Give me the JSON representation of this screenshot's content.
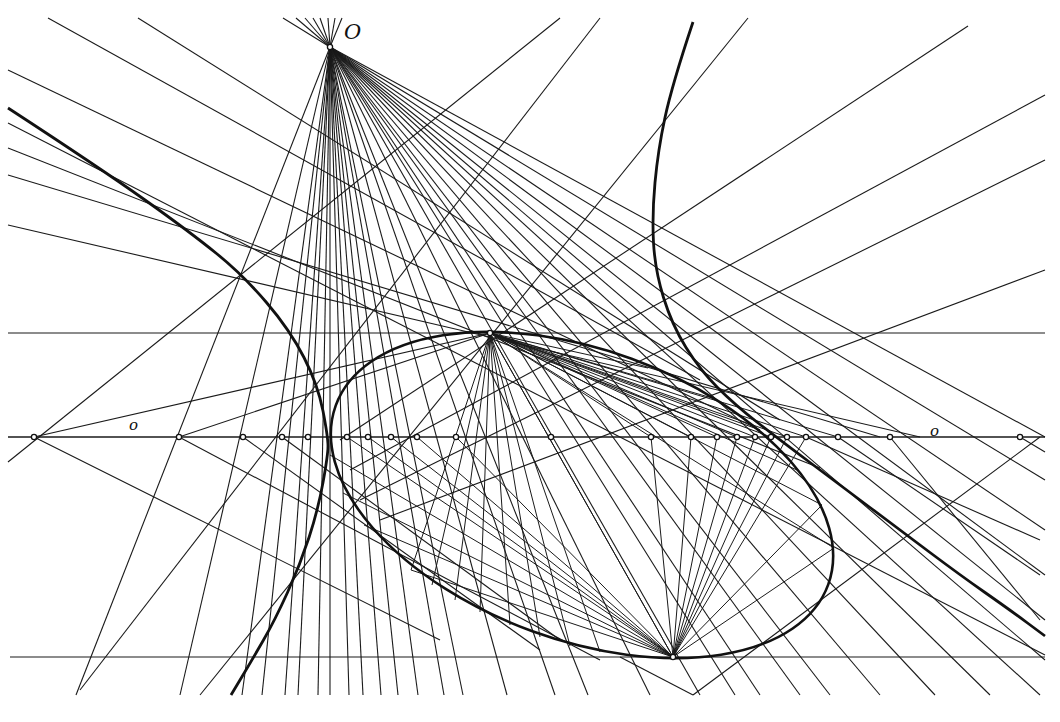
{
  "figure": {
    "type": "projective-geometry-construction",
    "background": "#ffffff",
    "ink_color": "#1a1a1a",
    "labels": {
      "center_point": "O",
      "axis_left": "o",
      "axis_right": "o"
    },
    "center_O": [
      330,
      47
    ],
    "axis": {
      "y": 437,
      "x_start": 8,
      "x_end": 1045
    },
    "horizontal_lines": [
      {
        "name": "upper-horizontal",
        "y": 333,
        "x_start": 8,
        "x_end": 1045
      },
      {
        "name": "lower-horizontal",
        "y": 657,
        "x_start": 10,
        "x_end": 1045
      }
    ],
    "axis_points": [
      34,
      179,
      243,
      282,
      308,
      347,
      368,
      391,
      417,
      456,
      551,
      651,
      691,
      717,
      737,
      755,
      771,
      787,
      806,
      838,
      890,
      1020
    ],
    "rays_from_O_to_bottom_x": [
      76,
      180,
      242,
      262,
      285,
      298,
      318,
      330,
      349,
      363,
      381,
      398,
      418,
      444,
      463,
      507,
      555,
      588
    ],
    "rays_from_O_to_right": [
      [
        1045,
        437
      ],
      [
        1045,
        480
      ],
      [
        1045,
        530
      ],
      [
        1045,
        575
      ],
      [
        1045,
        620
      ],
      [
        1045,
        660
      ],
      [
        1040,
        695
      ],
      [
        990,
        695
      ],
      [
        935,
        695
      ],
      [
        880,
        695
      ],
      [
        830,
        695
      ],
      [
        800,
        695
      ],
      [
        760,
        695
      ],
      [
        735,
        695
      ],
      [
        700,
        695
      ],
      [
        650,
        695
      ]
    ],
    "rays_from_O_upward": [
      [
        283,
        18
      ],
      [
        296,
        18
      ],
      [
        305,
        18
      ],
      [
        313,
        18
      ],
      [
        320,
        18
      ],
      [
        328,
        18
      ],
      [
        335,
        18
      ],
      [
        342,
        18
      ]
    ],
    "ellipse": {
      "cx": 582,
      "cy": 495,
      "rx": 262,
      "ry": 145,
      "rotation_deg": 20
    },
    "ellipse_points": {
      "top_point": [
        490,
        333
      ],
      "bottom_point": [
        673,
        657
      ]
    },
    "fan_from_top_point_to": [
      [
        411,
        570
      ],
      [
        432,
        585
      ],
      [
        455,
        600
      ],
      [
        480,
        612
      ],
      [
        510,
        625
      ],
      [
        540,
        637
      ],
      [
        570,
        646
      ],
      [
        600,
        652
      ],
      [
        673,
        657
      ],
      [
        651,
        437
      ],
      [
        690,
        437
      ],
      [
        717,
        437
      ],
      [
        737,
        437
      ],
      [
        755,
        437
      ],
      [
        771,
        437
      ],
      [
        787,
        437
      ],
      [
        806,
        437
      ],
      [
        838,
        437
      ],
      [
        834,
        548
      ],
      [
        822,
        505
      ],
      [
        797,
        470
      ],
      [
        760,
        430
      ],
      [
        712,
        398
      ],
      [
        648,
        368
      ]
    ],
    "fan_from_bottom_point_to": [
      [
        490,
        333
      ],
      [
        456,
        437
      ],
      [
        417,
        437
      ],
      [
        391,
        437
      ],
      [
        368,
        437
      ],
      [
        347,
        437
      ],
      [
        330,
        455
      ],
      [
        343,
        493
      ],
      [
        364,
        525
      ],
      [
        411,
        570
      ],
      [
        651,
        437
      ],
      [
        691,
        437
      ],
      [
        717,
        437
      ],
      [
        737,
        437
      ],
      [
        755,
        437
      ],
      [
        771,
        437
      ],
      [
        787,
        437
      ],
      [
        806,
        437
      ],
      [
        834,
        548
      ],
      [
        822,
        505
      ]
    ],
    "tangent_lines": [
      [
        [
          8,
          123
        ],
        [
          1045,
          655
        ]
      ],
      [
        [
          8,
          148
        ],
        [
          820,
          468
        ]
      ],
      [
        [
          8,
          175
        ],
        [
          880,
          437
        ]
      ],
      [
        [
          8,
          225
        ],
        [
          920,
          437
        ]
      ],
      [
        [
          8,
          70
        ],
        [
          760,
          430
        ]
      ],
      [
        [
          48,
          18
        ],
        [
          700,
          380
        ]
      ],
      [
        [
          138,
          18
        ],
        [
          780,
          420
        ]
      ],
      [
        [
          8,
          462
        ],
        [
          560,
          18
        ]
      ],
      [
        [
          80,
          690
        ],
        [
          600,
          18
        ]
      ],
      [
        [
          200,
          695
        ],
        [
          748,
          18
        ]
      ],
      [
        [
          340,
          440
        ],
        [
          968,
          26
        ]
      ],
      [
        [
          350,
          470
        ],
        [
          1045,
          95
        ]
      ],
      [
        [
          360,
          500
        ],
        [
          1045,
          160
        ]
      ],
      [
        [
          380,
          520
        ],
        [
          1045,
          270
        ]
      ],
      [
        [
          34,
          437
        ],
        [
          490,
          333
        ]
      ],
      [
        [
          34,
          437
        ],
        [
          440,
          640
        ]
      ],
      [
        [
          179,
          437
        ],
        [
          490,
          333
        ]
      ],
      [
        [
          179,
          437
        ],
        [
          600,
          660
        ]
      ],
      [
        [
          620,
          657
        ],
        [
          693,
          695
        ]
      ],
      [
        [
          693,
          695
        ],
        [
          1040,
          437
        ]
      ],
      [
        [
          243,
          437
        ],
        [
          540,
          650
        ]
      ],
      [
        [
          282,
          437
        ],
        [
          560,
          640
        ]
      ],
      [
        [
          890,
          437
        ],
        [
          1040,
          620
        ]
      ],
      [
        [
          1020,
          437
        ],
        [
          1045,
          452
        ]
      ],
      [
        [
          838,
          437
        ],
        [
          1040,
          575
        ]
      ],
      [
        [
          806,
          437
        ],
        [
          1040,
          540
        ]
      ]
    ],
    "hyperbola_left": [
      [
        8,
        108
      ],
      [
        100,
        168
      ],
      [
        190,
        232
      ],
      [
        243,
        275
      ],
      [
        290,
        330
      ],
      [
        318,
        385
      ],
      [
        328,
        437
      ],
      [
        328,
        455
      ],
      [
        318,
        510
      ],
      [
        300,
        565
      ],
      [
        275,
        620
      ],
      [
        252,
        660
      ],
      [
        231,
        695
      ]
    ],
    "hyperbola_right": [
      [
        693,
        22
      ],
      [
        672,
        85
      ],
      [
        658,
        150
      ],
      [
        652,
        215
      ],
      [
        655,
        270
      ],
      [
        672,
        325
      ],
      [
        700,
        370
      ],
      [
        735,
        405
      ],
      [
        780,
        440
      ],
      [
        840,
        485
      ],
      [
        900,
        530
      ],
      [
        960,
        575
      ],
      [
        1010,
        610
      ],
      [
        1045,
        636
      ]
    ]
  }
}
